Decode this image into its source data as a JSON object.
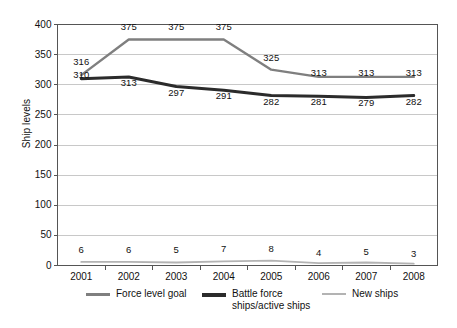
{
  "chart_data": {
    "type": "line",
    "title": "",
    "xlabel": "",
    "ylabel": "Ship levels",
    "categories": [
      "2001",
      "2002",
      "2003",
      "2004",
      "2005",
      "2006",
      "2007",
      "2008"
    ],
    "ylim": [
      0,
      400
    ],
    "yticks": [
      0,
      50,
      100,
      150,
      200,
      250,
      300,
      350,
      400
    ],
    "ytick_labels": [
      "0",
      "50",
      "100",
      "150",
      "200",
      "250",
      "300",
      "350",
      "400"
    ],
    "grid": true,
    "legend_position": "bottom",
    "series": [
      {
        "name": "Force level goal",
        "color": "#7f7f7f",
        "values": [
          316,
          375,
          375,
          375,
          325,
          313,
          313,
          313
        ],
        "labels": [
          "316",
          "375",
          "375",
          "375",
          "325",
          "313",
          "313",
          "313"
        ]
      },
      {
        "name": "Battle force\nships/active ships",
        "color": "#2b2b2b",
        "values": [
          310,
          313,
          297,
          291,
          282,
          281,
          279,
          282
        ],
        "labels": [
          "310",
          "313",
          "297",
          "291",
          "282",
          "281",
          "279",
          "282"
        ]
      },
      {
        "name": "New ships",
        "color": "#b3b3b3",
        "values": [
          6,
          6,
          5,
          7,
          8,
          4,
          5,
          3
        ],
        "labels": [
          "6",
          "6",
          "5",
          "7",
          "8",
          "4",
          "5",
          "3"
        ]
      }
    ]
  },
  "axis": {
    "y_title": "Ship levels"
  },
  "legend": {
    "items": [
      {
        "label": "Force level goal"
      },
      {
        "label": "Battle force\nships/active ships"
      },
      {
        "label": "New ships"
      }
    ]
  },
  "colors": {
    "force_level_goal": "#7f7f7f",
    "battle_force": "#2b2b2b",
    "new_ships": "#b3b3b3",
    "gridline": "#c8c8c8",
    "axis": "#555555",
    "background": "#ffffff"
  }
}
